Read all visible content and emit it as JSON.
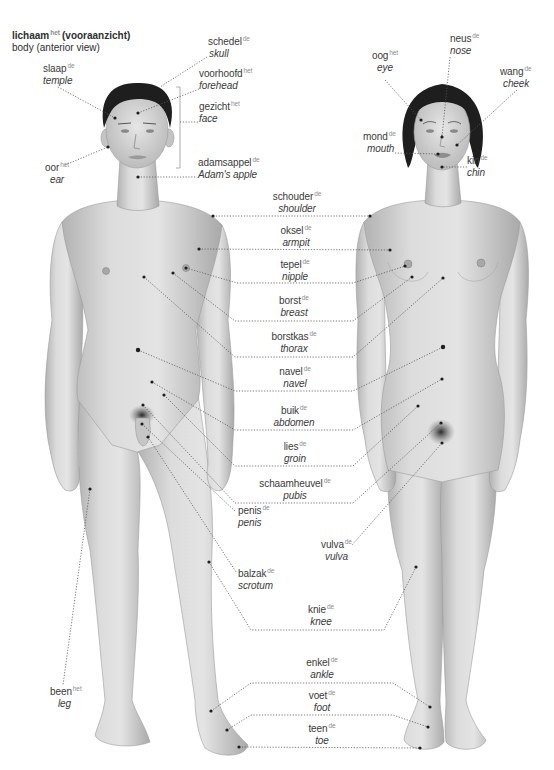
{
  "title": {
    "main": "lichaam",
    "article": "het",
    "suffix": "(vooraanzicht)",
    "subtitle": "body (anterior view)"
  },
  "labels": [
    {
      "dutch": "schedel",
      "article": "de",
      "english": "skull"
    },
    {
      "dutch": "slaap",
      "article": "de",
      "english": "temple"
    },
    {
      "dutch": "voorhoofd",
      "article": "het",
      "english": "forehead"
    },
    {
      "dutch": "gezicht",
      "article": "het",
      "english": "face"
    },
    {
      "dutch": "oor",
      "article": "het",
      "english": "ear"
    },
    {
      "dutch": "adamsappel",
      "article": "de",
      "english": "Adam's apple"
    },
    {
      "dutch": "oog",
      "article": "het",
      "english": "eye"
    },
    {
      "dutch": "neus",
      "article": "de",
      "english": "nose"
    },
    {
      "dutch": "wang",
      "article": "de",
      "english": "cheek"
    },
    {
      "dutch": "mond",
      "article": "de",
      "english": "mouth"
    },
    {
      "dutch": "kin",
      "article": "de",
      "english": "chin"
    },
    {
      "dutch": "schouder",
      "article": "de",
      "english": "shoulder"
    },
    {
      "dutch": "oksel",
      "article": "de",
      "english": "armpit"
    },
    {
      "dutch": "tepel",
      "article": "de",
      "english": "nipple"
    },
    {
      "dutch": "borst",
      "article": "de",
      "english": "breast"
    },
    {
      "dutch": "borstkas",
      "article": "de",
      "english": "thorax"
    },
    {
      "dutch": "navel",
      "article": "de",
      "english": "navel"
    },
    {
      "dutch": "buik",
      "article": "de",
      "english": "abdomen"
    },
    {
      "dutch": "lies",
      "article": "de",
      "english": "groin"
    },
    {
      "dutch": "schaamheuvel",
      "article": "de",
      "english": "pubis"
    },
    {
      "dutch": "penis",
      "article": "de",
      "english": "penis"
    },
    {
      "dutch": "vulva",
      "article": "de",
      "english": "vulva"
    },
    {
      "dutch": "balzak",
      "article": "de",
      "english": "scrotum"
    },
    {
      "dutch": "knie",
      "article": "de",
      "english": "knee"
    },
    {
      "dutch": "enkel",
      "article": "de",
      "english": "ankle"
    },
    {
      "dutch": "voet",
      "article": "de",
      "english": "foot"
    },
    {
      "dutch": "teen",
      "article": "de",
      "english": "toe"
    },
    {
      "dutch": "been",
      "article": "het",
      "english": "leg"
    }
  ],
  "colors": {
    "text": "#3a3a3a",
    "article": "#8c8c8c",
    "leader": "#555555",
    "skin_light": "#e2e2e2",
    "skin_shadow": "#adadad",
    "hair": "#1e1e1e"
  }
}
